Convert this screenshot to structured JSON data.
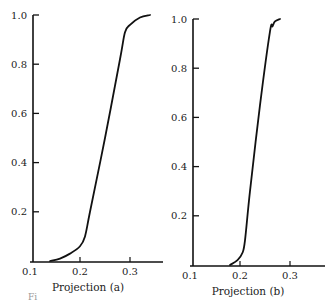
{
  "figure_caption_fragment": "Fi",
  "chart_data": [
    {
      "type": "line",
      "panel": "a",
      "title": "",
      "xlabel": "Projection (a)",
      "ylabel": "",
      "xlim": [
        0.1,
        0.35
      ],
      "ylim": [
        0.0,
        1.0
      ],
      "xticks": [
        "0.1",
        "0.2",
        "0.3"
      ],
      "yticks": [
        "0.2",
        "0.4",
        "0.6",
        "0.8",
        "1.0"
      ],
      "grid": false,
      "legend": null,
      "series": [
        {
          "name": "cumulative distribution (a)",
          "x": [
            0.14,
            0.16,
            0.18,
            0.2,
            0.21,
            0.22,
            0.25,
            0.28,
            0.29,
            0.3,
            0.32,
            0.34
          ],
          "y": [
            0.0,
            0.01,
            0.03,
            0.06,
            0.1,
            0.2,
            0.5,
            0.82,
            0.93,
            0.96,
            0.99,
            1.0
          ]
        }
      ]
    },
    {
      "type": "line",
      "panel": "b",
      "title": "",
      "xlabel": "Projection (b)",
      "ylabel": "",
      "xlim": [
        0.1,
        0.35
      ],
      "ylim": [
        0.0,
        1.0
      ],
      "xticks": [
        "0.1",
        "0.2",
        "0.3"
      ],
      "yticks": [
        "0.2",
        "0.4",
        "0.6",
        "0.8",
        "1.0"
      ],
      "grid": false,
      "legend": null,
      "series": [
        {
          "name": "cumulative distribution (b)",
          "x": [
            0.18,
            0.195,
            0.205,
            0.21,
            0.22,
            0.24,
            0.26,
            0.265,
            0.27,
            0.28
          ],
          "y": [
            0.0,
            0.02,
            0.05,
            0.1,
            0.3,
            0.65,
            0.95,
            0.97,
            0.99,
            1.0
          ]
        }
      ]
    }
  ]
}
